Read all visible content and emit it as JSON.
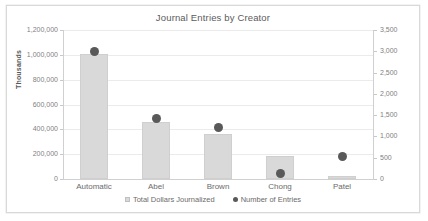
{
  "chart_data": {
    "type": "bar",
    "title": "Journal Entries by Creator",
    "xlabel": "",
    "ylabel": "Thousands",
    "y2label": "",
    "categories": [
      "Automatic",
      "Abel",
      "Brown",
      "Chong",
      "Patel"
    ],
    "series": [
      {
        "name": "Total Dollars Journalized",
        "type": "bar",
        "axis": "left",
        "color": "#d9d9d9",
        "values": [
          1010000,
          460000,
          365000,
          185000,
          25000
        ]
      },
      {
        "name": "Number of Entries",
        "type": "scatter",
        "axis": "right",
        "color": "#595959",
        "values": [
          3000,
          1430,
          1220,
          140,
          540
        ]
      }
    ],
    "ylim": [
      0,
      1200000
    ],
    "y2lim": [
      0,
      3500
    ],
    "yticks": [
      "0",
      "200,000",
      "400,000",
      "600,000",
      "800,000",
      "1,000,000",
      "1,200,000"
    ],
    "ytick_values": [
      0,
      200000,
      400000,
      600000,
      800000,
      1000000,
      1200000
    ],
    "y2ticks": [
      "0",
      "500",
      "1,000",
      "1,500",
      "2,000",
      "2,500",
      "3,000",
      "3,500"
    ],
    "y2tick_values": [
      0,
      500,
      1000,
      1500,
      2000,
      2500,
      3000,
      3500
    ],
    "grid": true,
    "legend_position": "bottom",
    "legend": [
      {
        "label": "Total Dollars Journalized",
        "marker": "square-swatch",
        "color": "#d9d9d9"
      },
      {
        "label": "Number of Entries",
        "marker": "circle-dot",
        "color": "#595959"
      }
    ]
  }
}
